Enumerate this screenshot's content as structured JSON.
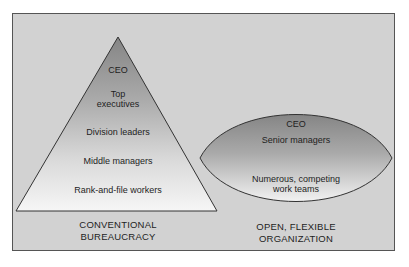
{
  "diagram": {
    "background_color": "#d2d2d2",
    "frame_border_color": "#555555",
    "pyramid": {
      "name": "Conventional bureaucracy",
      "caption_line1": "CONVENTIONAL",
      "caption_line2": "BUREAUCRACY",
      "gradient_top": "#8a8a8a",
      "gradient_bottom": "#f4f4f4",
      "levels": [
        {
          "label": "CEO"
        },
        {
          "label_line1": "Top",
          "label_line2": "executives"
        },
        {
          "label": "Division leaders"
        },
        {
          "label": "Middle managers"
        },
        {
          "label": "Rank-and-file workers"
        }
      ]
    },
    "lens": {
      "name": "Open, flexible organization",
      "caption_line1": "OPEN, FLEXIBLE",
      "caption_line2": "ORGANIZATION",
      "gradient_top": "#8a8a8a",
      "gradient_bottom": "#f2f2f2",
      "levels": [
        {
          "label": "CEO"
        },
        {
          "label": "Senior managers"
        },
        {
          "label_line1": "Numerous, competing",
          "label_line2": "work teams"
        }
      ]
    }
  }
}
